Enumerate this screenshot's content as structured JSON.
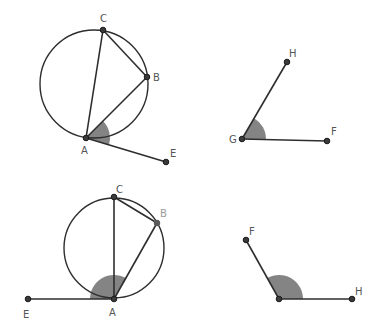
{
  "figures": [
    {
      "id": "top-left",
      "description": "Circle through A, B, C with chords AC, CB, AB and tangent segment AE; angle BAE shaded",
      "circle": {
        "cx": 94,
        "cy": 84,
        "r": 54
      },
      "points": {
        "A": {
          "x": 86,
          "y": 138,
          "label": "A",
          "lx": 81,
          "ly": 154
        },
        "B": {
          "x": 147,
          "y": 77,
          "label": "B",
          "lx": 153,
          "ly": 81
        },
        "C": {
          "x": 103,
          "y": 30,
          "label": "C",
          "lx": 100,
          "ly": 22
        },
        "E": {
          "x": 166,
          "y": 162,
          "label": "E",
          "lx": 170,
          "ly": 157
        }
      },
      "segments": [
        [
          "A",
          "C"
        ],
        [
          "C",
          "B"
        ],
        [
          "A",
          "B"
        ],
        [
          "A",
          "E"
        ]
      ],
      "angle": {
        "vertex": "A",
        "from": "E",
        "to": "B",
        "radius": 24
      }
    },
    {
      "id": "top-right",
      "description": "Angle HGF shaded",
      "points": {
        "G": {
          "x": 242,
          "y": 139,
          "label": "G",
          "lx": 229,
          "ly": 143
        },
        "H": {
          "x": 287,
          "y": 62,
          "label": "H",
          "lx": 289,
          "ly": 57
        },
        "F": {
          "x": 327,
          "y": 141,
          "label": "F",
          "lx": 331,
          "ly": 135
        }
      },
      "segments": [
        [
          "G",
          "H"
        ],
        [
          "G",
          "F"
        ]
      ],
      "angle": {
        "vertex": "G",
        "from": "F",
        "to": "H",
        "radius": 24
      }
    },
    {
      "id": "bottom-left",
      "description": "Circle through A, B, C with chords AC, CB, AB and tangent segment AE; angle BAE shaded (obtuse)",
      "circle": {
        "cx": 114,
        "cy": 248,
        "r": 50
      },
      "points": {
        "A": {
          "x": 114,
          "y": 299,
          "label": "A",
          "lx": 109,
          "ly": 316
        },
        "B": {
          "x": 157,
          "y": 223,
          "label": "B",
          "lx": 160,
          "ly": 217,
          "muted": true
        },
        "C": {
          "x": 114,
          "y": 197,
          "label": "C",
          "lx": 116,
          "ly": 193
        },
        "E": {
          "x": 28,
          "y": 299,
          "label": "E",
          "lx": 23,
          "ly": 318
        }
      },
      "segments": [
        [
          "A",
          "C"
        ],
        [
          "C",
          "B"
        ],
        [
          "A",
          "B"
        ],
        [
          "A",
          "E"
        ]
      ],
      "angle": {
        "vertex": "A",
        "from": "B",
        "to": "E",
        "radius": 24
      }
    },
    {
      "id": "bottom-right",
      "description": "Angle F-vertex-H shaded (obtuse), vertex unlabeled",
      "points": {
        "V": {
          "x": 279,
          "y": 299,
          "label": ""
        },
        "F": {
          "x": 246,
          "y": 240,
          "label": "F",
          "lx": 249,
          "ly": 235
        },
        "H": {
          "x": 352,
          "y": 299,
          "label": "H",
          "lx": 355,
          "ly": 295
        }
      },
      "segments": [
        [
          "V",
          "F"
        ],
        [
          "V",
          "H"
        ]
      ],
      "angle": {
        "vertex": "V",
        "from": "H",
        "to": "F",
        "radius": 24
      }
    }
  ],
  "colors": {
    "line": "#2e2e2e",
    "sector": "#6f6f6f",
    "label": "#555555",
    "label_muted": "#9a9a9a",
    "background": "#ffffff"
  }
}
